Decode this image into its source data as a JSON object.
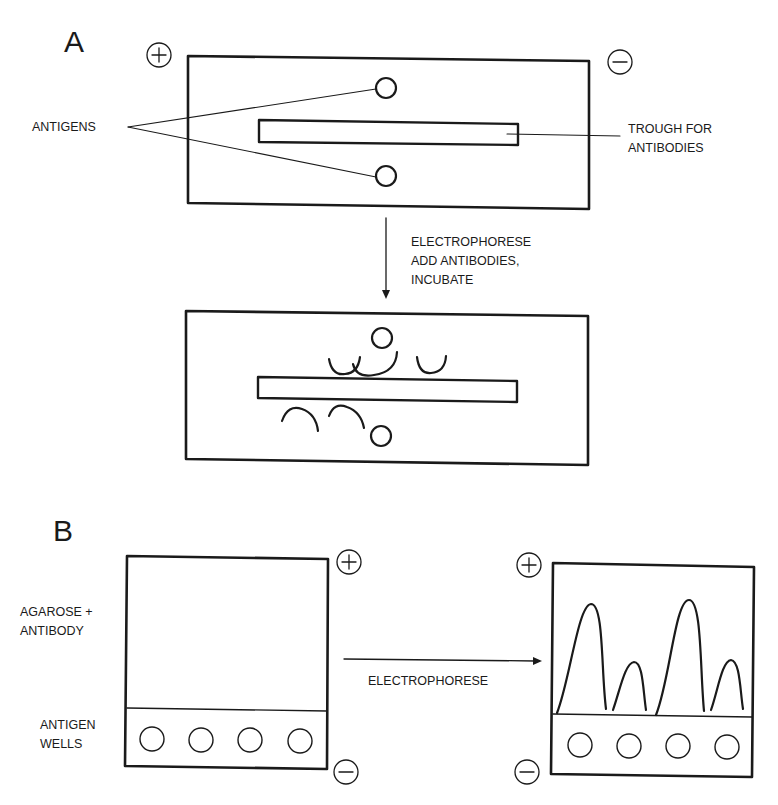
{
  "colors": {
    "ink": "#1a1a1a",
    "background": "#ffffff"
  },
  "panel_a": {
    "letter": "A",
    "labels": {
      "antigens": "ANTIGENS",
      "trough_line1": "TROUGH FOR",
      "trough_line2": "ANTIBODIES",
      "step_line1": "ELECTROPHORESE",
      "step_line2": "ADD ANTIBODIES,",
      "step_line3": "INCUBATE"
    },
    "electrodes": {
      "anode": "plus-electrode",
      "cathode": "minus-electrode"
    }
  },
  "panel_b": {
    "letter": "B",
    "labels": {
      "agarose_line1": "AGAROSE +",
      "agarose_line2": "ANTIBODY",
      "wells_line1": "ANTIGEN",
      "wells_line2": "WELLS",
      "step": "ELECTROPHORESE"
    },
    "wells_count": 4,
    "rocket_peaks": [
      {
        "well": 1,
        "relative_height": "tall"
      },
      {
        "well": 2,
        "relative_height": "short"
      },
      {
        "well": 3,
        "relative_height": "tall"
      },
      {
        "well": 4,
        "relative_height": "short"
      }
    ]
  }
}
